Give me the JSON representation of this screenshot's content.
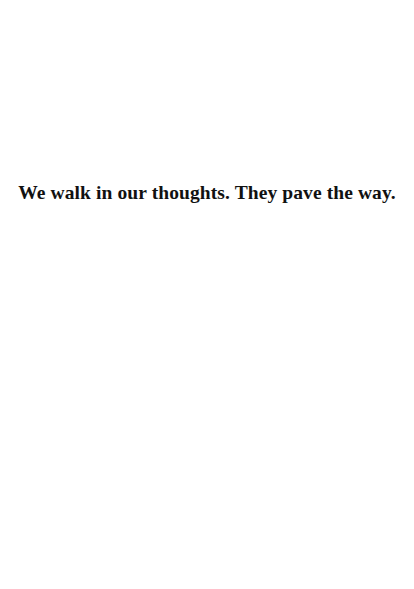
{
  "page": {
    "background": "#ffffff",
    "text_color": "#111111"
  },
  "quote": {
    "text": "We walk in our thoughts. They pave the way."
  }
}
